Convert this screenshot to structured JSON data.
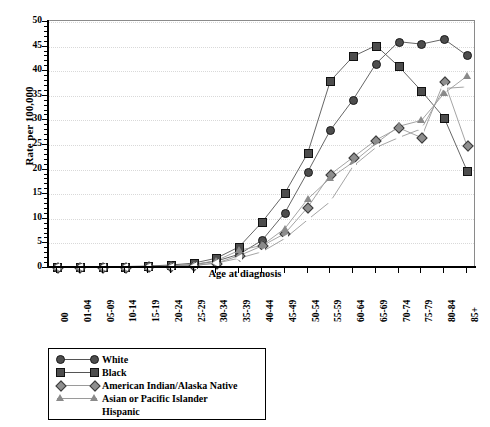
{
  "chart_data": {
    "type": "line",
    "title": "",
    "xlabel": "Age at diagnosis",
    "ylabel": "Rate per 100,000",
    "ylim": [
      0,
      50
    ],
    "ytick_step": 5,
    "yticks": [
      0,
      5,
      10,
      15,
      20,
      25,
      30,
      35,
      40,
      45,
      50
    ],
    "grid": true,
    "legend_position": "below-left",
    "categories": [
      "00",
      "01-04",
      "05-09",
      "10-14",
      "15-19",
      "20-24",
      "25-29",
      "30-34",
      "35-39",
      "40-44",
      "45-49",
      "50-54",
      "55-59",
      "60-64",
      "65-69",
      "70-74",
      "75-79",
      "80-84",
      "85+"
    ],
    "series": [
      {
        "name": "White",
        "marker": "circle",
        "color": "#4d4d4d",
        "values": [
          0.2,
          0.2,
          0.2,
          0.2,
          0.3,
          0.4,
          0.7,
          1.4,
          2.8,
          5.6,
          11.2,
          19.5,
          28.0,
          34.2,
          41.5,
          46.0,
          45.5,
          46.5,
          43.2
        ]
      },
      {
        "name": "Black",
        "marker": "square",
        "color": "#4d4d4d",
        "values": [
          0.2,
          0.2,
          0.2,
          0.3,
          0.4,
          0.6,
          1.0,
          2.0,
          4.3,
          9.3,
          15.2,
          23.3,
          38.0,
          43.0,
          45.2,
          41.0,
          36.0,
          30.5,
          19.8
        ]
      },
      {
        "name": "American Indian/Alaska Native",
        "marker": "diamond",
        "color": "#8f8f8f",
        "values": [
          0.2,
          0.2,
          0.2,
          0.2,
          0.3,
          0.3,
          0.5,
          1.0,
          2.5,
          4.5,
          7.0,
          12.3,
          19.0,
          22.5,
          26.0,
          28.5,
          26.5,
          38.0,
          24.8
        ]
      },
      {
        "name": "Asian or Pacific Islander",
        "marker": "triangle",
        "color": "#8a8a8a",
        "values": [
          0.2,
          0.2,
          0.2,
          0.2,
          0.3,
          0.4,
          0.7,
          1.5,
          3.6,
          4.6,
          8.0,
          14.0,
          18.3,
          21.5,
          25.3,
          28.8,
          30.0,
          35.5,
          39.0
        ]
      },
      {
        "name": "Hispanic",
        "marker": "left-triangle",
        "color": "#ffffff",
        "values": [
          0.2,
          0.2,
          0.2,
          0.2,
          0.2,
          0.3,
          0.5,
          1.0,
          2.0,
          3.3,
          6.0,
          9.8,
          13.5,
          20.7,
          24.5,
          26.5,
          28.3,
          36.5,
          36.8
        ]
      }
    ]
  },
  "axes": {
    "y_title": "Rate per 100,000",
    "x_title": "Age at diagnosis"
  },
  "legend": {
    "items": [
      {
        "label": "White",
        "marker": "circle"
      },
      {
        "label": "Black",
        "marker": "square"
      },
      {
        "label": "American Indian/Alaska Native",
        "marker": "diamond"
      },
      {
        "label": "Asian or Pacific Islander",
        "marker": "triangle"
      },
      {
        "label": "Hispanic",
        "marker": "left-triangle"
      }
    ]
  }
}
